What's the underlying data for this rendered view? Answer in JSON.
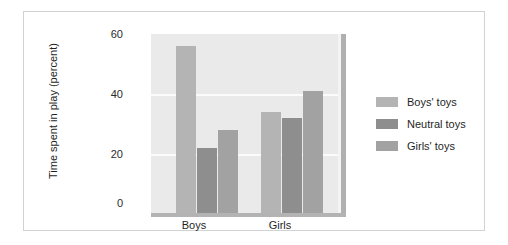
{
  "chart_data": {
    "type": "bar",
    "title": "",
    "subtitle": "",
    "xlabel": "",
    "ylabel": "Time spent in play (percent)",
    "categories": [
      "Boys",
      "Girls"
    ],
    "series": [
      {
        "name": "Boys' toys",
        "values": [
          56,
          34
        ],
        "color": "#b4b4b4"
      },
      {
        "name": "Neutral toys",
        "values": [
          22,
          32
        ],
        "color": "#8e8e8e"
      },
      {
        "name": "Girls' toys",
        "values": [
          28,
          41
        ],
        "color": "#a2a2a2"
      }
    ],
    "ylim": [
      0,
      60
    ],
    "yticks": [
      "0",
      "20",
      "40",
      "60"
    ],
    "ytick_values": [
      0,
      20,
      40,
      60
    ],
    "grid": true,
    "grid_axis": "y",
    "legend_position": "right",
    "plot_background": "#eaeaea",
    "figure_background": "#ffffff",
    "annotations": []
  },
  "axis": {
    "y": {
      "label": "Time spent in play (percent)",
      "ticks": [
        {
          "label": "60",
          "value": 60
        },
        {
          "label": "40",
          "value": 40
        },
        {
          "label": "20",
          "value": 20
        },
        {
          "label": "0",
          "value": 0
        }
      ]
    },
    "x": {
      "label": "",
      "ticks": [
        {
          "label": "Boys"
        },
        {
          "label": "Girls"
        }
      ]
    }
  },
  "legend": {
    "items": [
      {
        "label": "Boys' toys",
        "color": "#b4b4b4"
      },
      {
        "label": "Neutral toys",
        "color": "#8e8e8e"
      },
      {
        "label": "Girls' toys",
        "color": "#a2a2a2"
      }
    ]
  }
}
